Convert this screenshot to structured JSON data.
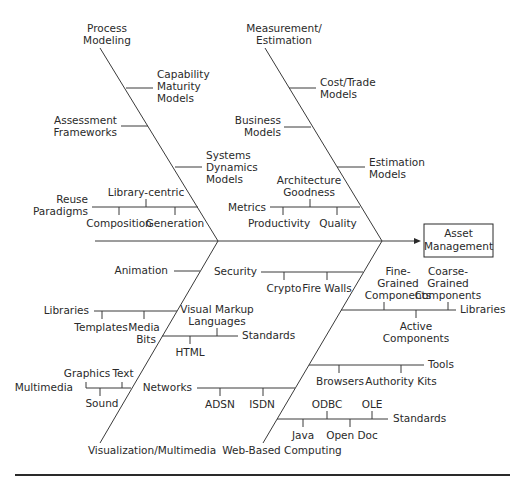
{
  "diagram": {
    "type": "fishbone",
    "effect": [
      "Asset",
      "Management"
    ],
    "categories": {
      "process_modeling": {
        "label": [
          "Process",
          "Modeling"
        ],
        "causes": [
          {
            "label": [
              "Capability",
              "Maturity",
              "Models"
            ]
          },
          {
            "label": [
              "Assessment",
              "Frameworks"
            ]
          },
          {
            "label": [
              "Systems",
              "Dynamics",
              "Models"
            ]
          },
          {
            "label": [
              "Reuse",
              "Paradigms"
            ],
            "sub": [
              "Library-centric",
              "Composition",
              "Generation"
            ]
          }
        ]
      },
      "measurement_estimation": {
        "label": [
          "Measurement/",
          "Estimation"
        ],
        "causes": [
          {
            "label": [
              "Cost/Trade",
              "Models"
            ]
          },
          {
            "label": [
              "Business",
              "Models"
            ]
          },
          {
            "label": [
              "Estimation",
              "Models"
            ]
          },
          {
            "label": [
              "Metrics"
            ],
            "sub": [
              "Architecture",
              "Goodness",
              "Productivity",
              "Quality"
            ]
          }
        ]
      },
      "visualization_multimedia": {
        "label": [
          "Visualization/Multimedia"
        ],
        "causes": [
          {
            "label": [
              "Animation"
            ]
          },
          {
            "label": [
              "Libraries"
            ],
            "sub": [
              "Templates",
              "Media",
              "Bits"
            ]
          },
          {
            "label": [
              "Multimedia"
            ],
            "sub": [
              "Graphics",
              "Text",
              "Sound"
            ]
          }
        ]
      },
      "web_based_computing": {
        "label": [
          "Web-Based Computing"
        ],
        "causes": [
          {
            "label": [
              "Security"
            ],
            "sub": [
              "Crypto",
              "Fire Walls"
            ]
          },
          {
            "label": [
              "Visual Markup",
              "Languages"
            ]
          },
          {
            "label": [
              "Standards"
            ],
            "sub": [
              "HTML"
            ]
          },
          {
            "label": [
              "Networks"
            ],
            "sub": [
              "ADSN",
              "ISDN"
            ]
          },
          {
            "label": [
              "Libraries"
            ],
            "sub": [
              "Fine-",
              "Grained",
              "Components",
              "Coarse-",
              "Grained",
              "Components",
              "Active",
              "Components"
            ]
          },
          {
            "label": [
              "Tools"
            ],
            "sub": [
              "Browsers",
              "Authority Kits"
            ]
          },
          {
            "label": [
              "Standards"
            ],
            "sub": [
              "ODBC",
              "OLE",
              "Java",
              "Open Doc"
            ]
          }
        ]
      }
    }
  }
}
